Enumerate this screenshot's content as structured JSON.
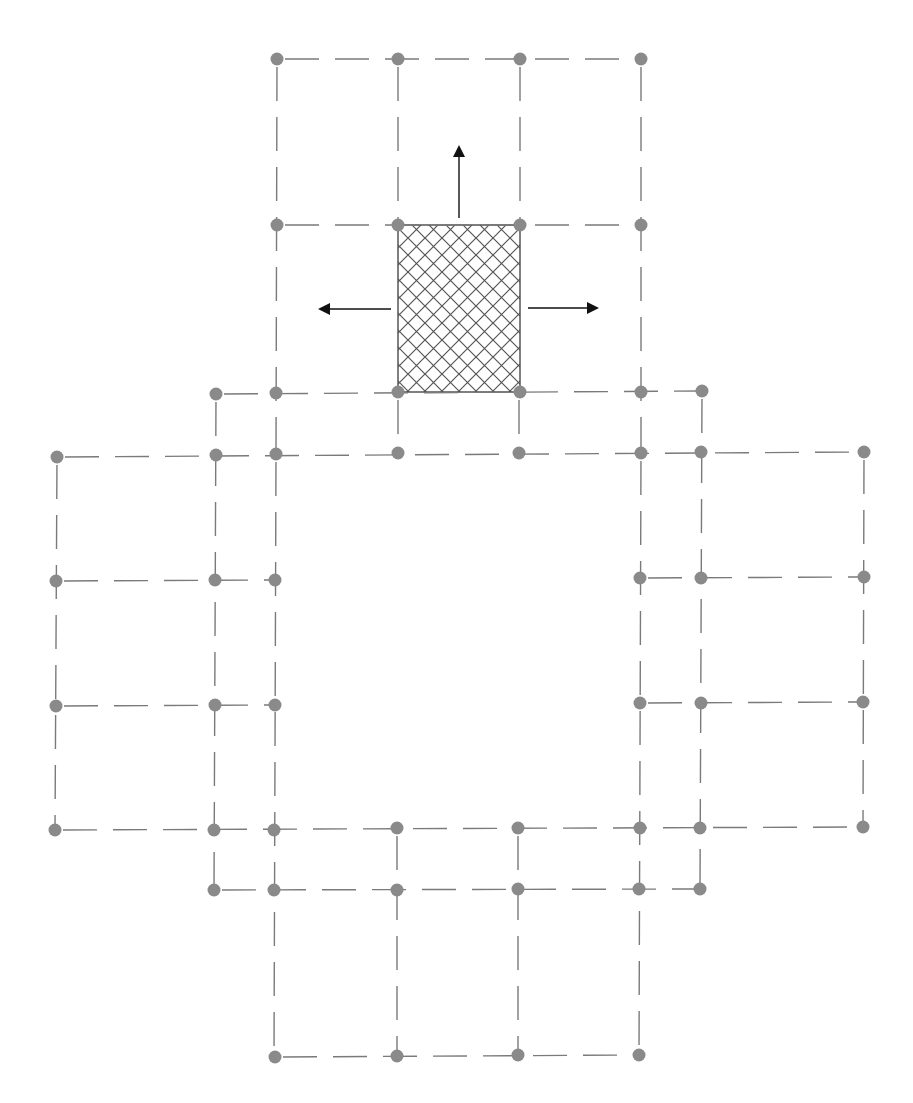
{
  "page_header": {
    "page_number": "",
    "running_title": "",
    "note": "clipped running header, unreadable"
  },
  "figure": {
    "colors": {
      "node": "#8a8a8a",
      "dash": "#7a7a7a",
      "hatch": "#555555",
      "arrow": "#111111",
      "background": "#ffffff"
    },
    "nodes": [
      [
        277,
        59
      ],
      [
        398,
        59
      ],
      [
        520,
        59
      ],
      [
        641,
        59
      ],
      [
        277,
        225
      ],
      [
        398,
        225
      ],
      [
        520,
        225
      ],
      [
        641,
        225
      ],
      [
        216,
        394
      ],
      [
        276,
        393
      ],
      [
        398,
        392
      ],
      [
        520,
        392
      ],
      [
        641,
        392
      ],
      [
        702,
        391
      ],
      [
        57,
        457
      ],
      [
        216,
        455
      ],
      [
        276,
        454
      ],
      [
        398,
        453
      ],
      [
        519,
        453
      ],
      [
        641,
        453
      ],
      [
        701,
        452
      ],
      [
        864,
        452
      ],
      [
        56,
        581
      ],
      [
        215,
        580
      ],
      [
        275,
        580
      ],
      [
        640,
        578
      ],
      [
        701,
        578
      ],
      [
        864,
        577
      ],
      [
        56,
        706
      ],
      [
        215,
        705
      ],
      [
        275,
        705
      ],
      [
        640,
        703
      ],
      [
        701,
        703
      ],
      [
        863,
        702
      ],
      [
        55,
        830
      ],
      [
        214,
        830
      ],
      [
        274,
        830
      ],
      [
        397,
        828
      ],
      [
        518,
        828
      ],
      [
        640,
        828
      ],
      [
        700,
        828
      ],
      [
        863,
        827
      ],
      [
        214,
        890
      ],
      [
        274,
        890
      ],
      [
        397,
        890
      ],
      [
        518,
        889
      ],
      [
        639,
        889
      ],
      [
        700,
        889
      ],
      [
        275,
        1057
      ],
      [
        397,
        1056
      ],
      [
        518,
        1055
      ],
      [
        639,
        1055
      ]
    ],
    "dashed_lines": [
      [
        277,
        59,
        641,
        59
      ],
      [
        277,
        225,
        641,
        225
      ],
      [
        216,
        394,
        702,
        391
      ],
      [
        57,
        457,
        864,
        452
      ],
      [
        56,
        581,
        275,
        580
      ],
      [
        640,
        578,
        864,
        577
      ],
      [
        56,
        706,
        275,
        705
      ],
      [
        640,
        703,
        863,
        702
      ],
      [
        55,
        830,
        863,
        827
      ],
      [
        214,
        890,
        700,
        889
      ],
      [
        275,
        1057,
        639,
        1055
      ],
      [
        277,
        59,
        276,
        454
      ],
      [
        398,
        59,
        398,
        225
      ],
      [
        520,
        59,
        520,
        225
      ],
      [
        641,
        59,
        641,
        453
      ],
      [
        398,
        392,
        398,
        453
      ],
      [
        519,
        392,
        519,
        453
      ],
      [
        216,
        394,
        214,
        890
      ],
      [
        702,
        391,
        700,
        889
      ],
      [
        276,
        454,
        274,
        1057
      ],
      [
        641,
        453,
        639,
        1055
      ],
      [
        57,
        457,
        55,
        830
      ],
      [
        864,
        452,
        863,
        827
      ],
      [
        397,
        828,
        397,
        1056
      ],
      [
        518,
        828,
        518,
        1055
      ]
    ],
    "hatched_cell": {
      "x1": 398,
      "y1": 225,
      "x2": 520,
      "y2": 392
    },
    "arrows": [
      {
        "direction": "up",
        "from": [
          459,
          218
        ],
        "to": [
          459,
          147
        ]
      },
      {
        "direction": "left",
        "from": [
          391,
          309
        ],
        "to": [
          320,
          309
        ]
      },
      {
        "direction": "right",
        "from": [
          528,
          308
        ],
        "to": [
          597,
          308
        ]
      }
    ]
  }
}
